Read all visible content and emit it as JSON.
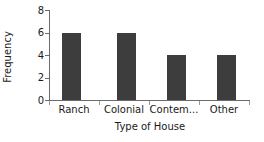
{
  "chart_data": {
    "type": "bar",
    "title": "",
    "categories": [
      "Ranch",
      "Colonial",
      "Contem...",
      "Other"
    ],
    "values": [
      6,
      6,
      4,
      4
    ],
    "xlabel": "Type of House",
    "ylabel": "Frequency",
    "ylim": [
      0,
      8
    ],
    "yticks": [
      0,
      2,
      4,
      6,
      8
    ],
    "ytick_labels": [
      "0",
      "2",
      "4",
      "6",
      "8"
    ],
    "grid": false,
    "legend": false,
    "bar_color": "#3d3d3d",
    "axis_color": "#6b6b6b",
    "background": "#ffffff"
  }
}
